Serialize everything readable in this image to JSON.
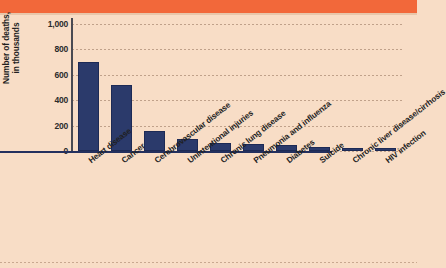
{
  "figure": {
    "background_color": "#f8ddc6",
    "band_color": "#f2683a",
    "bar_color": "#2b3a6b"
  },
  "chart_data": {
    "type": "bar",
    "title": "",
    "xlabel": "",
    "ylabel": "Number of deaths, in thousands",
    "ylabel_line1": "Number of deaths,",
    "ylabel_line2": "in thousands",
    "ylim": [
      0,
      1000
    ],
    "yticks": [
      0,
      200,
      400,
      600,
      800,
      1000
    ],
    "ytick_labels": [
      "0",
      "200",
      "400",
      "600",
      "800",
      "1,000"
    ],
    "grid": true,
    "legend": "none",
    "categories": [
      "Heart disease",
      "Cancer",
      "Cerebrovascular disease",
      "Unintentional injuries",
      "Chronic lung disease",
      "Pneumonia and influenza",
      "Diabetes",
      "Suicide",
      "Chronic liver disease/cirrhosis",
      "HIV infection"
    ],
    "values": [
      700,
      520,
      160,
      93,
      62,
      55,
      45,
      31,
      25,
      16
    ]
  }
}
